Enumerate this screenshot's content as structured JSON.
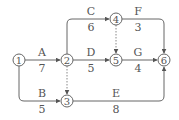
{
  "diagram": {
    "type": "activity-on-arrow network",
    "colors": {
      "line": "#666666",
      "dashed": "#888888",
      "text": "#555555",
      "background": "#ffffff"
    },
    "nodes": [
      {
        "id": "1",
        "label": "1",
        "x": 19,
        "y": 60
      },
      {
        "id": "2",
        "label": "2",
        "x": 67,
        "y": 60
      },
      {
        "id": "3",
        "label": "3",
        "x": 67,
        "y": 101
      },
      {
        "id": "4",
        "label": "4",
        "x": 116,
        "y": 19
      },
      {
        "id": "5",
        "label": "5",
        "x": 116,
        "y": 60
      },
      {
        "id": "6",
        "label": "6",
        "x": 164,
        "y": 60
      }
    ],
    "activities": [
      {
        "name": "A",
        "duration": "7",
        "from": "1",
        "to": "2"
      },
      {
        "name": "B",
        "duration": "5",
        "from": "1",
        "to": "3"
      },
      {
        "name": "C",
        "duration": "6",
        "from": "2",
        "to": "4"
      },
      {
        "name": "D",
        "duration": "5",
        "from": "2",
        "to": "5"
      },
      {
        "name": "E",
        "duration": "8",
        "from": "3",
        "to": "6"
      },
      {
        "name": "F",
        "duration": "3",
        "from": "4",
        "to": "6"
      },
      {
        "name": "G",
        "duration": "4",
        "from": "5",
        "to": "6"
      }
    ],
    "dummy_activities": [
      {
        "from": "2",
        "to": "3"
      },
      {
        "from": "4",
        "to": "5"
      }
    ]
  }
}
